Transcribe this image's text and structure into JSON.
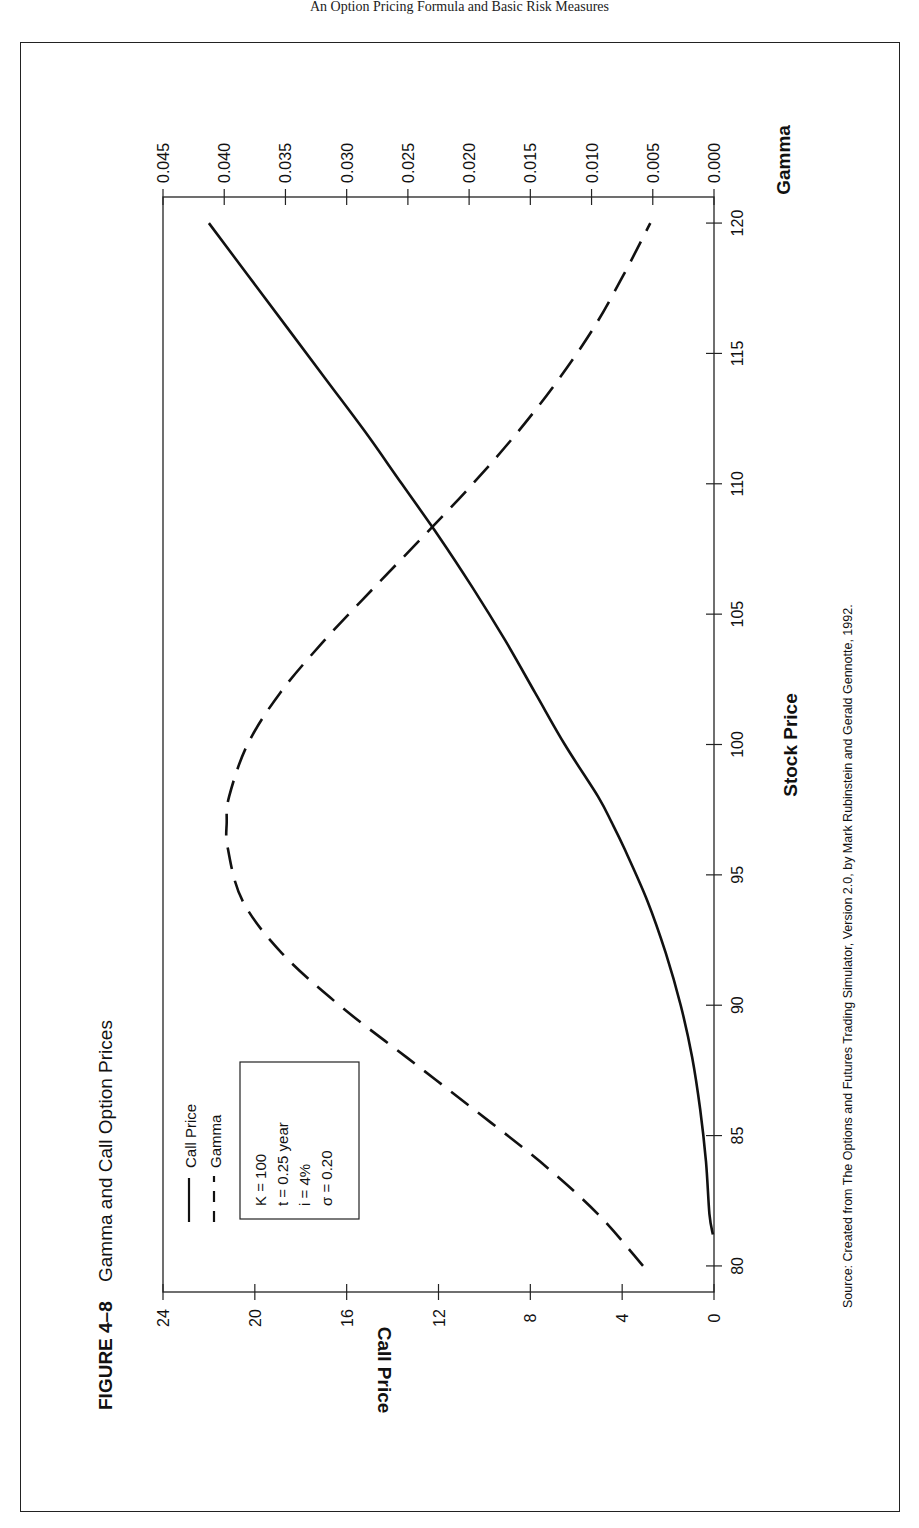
{
  "page": {
    "header_text": "An Option Pricing Formula and Basic Risk Measures"
  },
  "figure": {
    "label": "FIGURE 4–8",
    "title": "Gamma and Call Option Prices",
    "source": "Source: Created from The Options and Futures Trading Simulator, Version 2.0, by Mark Rubinstein and Gerald Gennotte, 1992.",
    "legend": {
      "items": [
        {
          "label": "Call Price",
          "style": "solid"
        },
        {
          "label": "Gamma",
          "style": "dashed"
        }
      ]
    },
    "params_box": {
      "lines": [
        "K = 100",
        "t = 0.25 year",
        "i = 4%",
        "σ = 0.20"
      ]
    },
    "axes": {
      "x_label": "Stock Price",
      "left_label": "Call Price",
      "right_label": "Gamma",
      "x_ticks": [
        "80",
        "85",
        "90",
        "95",
        "100",
        "105",
        "110",
        "115",
        "120"
      ],
      "left_ticks": [
        "0",
        "4",
        "8",
        "12",
        "16",
        "20",
        "24"
      ],
      "right_ticks": [
        "0.000",
        "0.005",
        "0.010",
        "0.015",
        "0.020",
        "0.025",
        "0.030",
        "0.035",
        "0.040",
        "0.045"
      ]
    }
  },
  "chart_data": {
    "type": "line",
    "title": "Gamma and Call Option Prices",
    "xlabel": "Stock Price",
    "ylabel": "Call Price",
    "y2label": "Gamma",
    "xlim": [
      79,
      121
    ],
    "ylim": [
      0,
      24
    ],
    "y2lim": [
      0,
      0.045
    ],
    "orientation": "rotated 90° counter-clockwise on page",
    "grid": false,
    "legend_position": "upper left (inside plot)",
    "annotations": [
      "K = 100",
      "t = 0.25 year",
      "i = 4%",
      "σ = 0.20"
    ],
    "x": [
      80,
      82,
      84,
      86,
      88,
      90,
      92,
      94,
      96,
      97,
      98,
      100,
      102,
      104,
      106,
      108,
      110,
      112,
      114,
      116,
      118,
      120
    ],
    "series": [
      {
        "name": "Call Price",
        "axis": "left",
        "style": "solid",
        "values": [
          0.1,
          0.2,
          0.35,
          0.6,
          0.95,
          1.45,
          2.1,
          2.9,
          3.9,
          4.45,
          5.05,
          6.5,
          7.8,
          9.1,
          10.5,
          12.0,
          13.6,
          15.2,
          16.9,
          18.6,
          20.3,
          22.0
        ]
      },
      {
        "name": "Gamma",
        "axis": "right",
        "style": "dashed",
        "values": [
          0.0058,
          0.0095,
          0.0142,
          0.0196,
          0.0251,
          0.0306,
          0.0353,
          0.0385,
          0.0397,
          0.0398,
          0.0396,
          0.0381,
          0.0354,
          0.0318,
          0.0278,
          0.0237,
          0.0197,
          0.016,
          0.0127,
          0.0098,
          0.0074,
          0.0052
        ]
      }
    ]
  }
}
